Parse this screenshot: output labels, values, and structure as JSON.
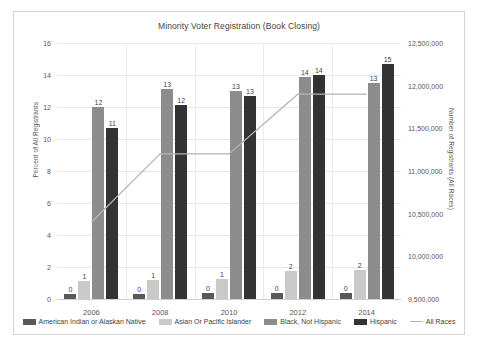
{
  "chart_data": {
    "type": "bar",
    "title": "Minority Voter Registration (Book Closing)",
    "categories": [
      "2006",
      "2008",
      "2010",
      "2012",
      "2014"
    ],
    "xlabel": "",
    "ylabel": "Percent of All Registrants",
    "ylim": [
      0,
      16
    ],
    "y_ticks": [
      "0",
      "2",
      "4",
      "6",
      "8",
      "10",
      "12",
      "14",
      "16"
    ],
    "y2label": "Number of Registrants (All Races)",
    "y2lim": [
      9500000,
      12500000
    ],
    "y2_ticks": [
      "9,500,000",
      "10,000,000",
      "10,500,000",
      "11,000,000",
      "11,500,000",
      "12,000,000",
      "12,500,000"
    ],
    "grid": true,
    "legend_position": "bottom",
    "series": [
      {
        "name": "American Indian or Alaskan Native",
        "type": "bar",
        "axis": "left",
        "color": "#595959",
        "values": [
          0,
          0,
          0,
          0,
          0
        ],
        "labels": [
          "0",
          "0",
          "0",
          "0",
          "0"
        ],
        "plot_values": [
          0.3,
          0.3,
          0.35,
          0.35,
          0.4
        ]
      },
      {
        "name": "Asian Or Pacific Islander",
        "type": "bar",
        "axis": "left",
        "color": "#c9c9c9",
        "values": [
          1,
          1,
          1,
          2,
          2
        ],
        "labels": [
          "1",
          "1",
          "1",
          "2",
          "2"
        ],
        "plot_values": [
          1.1,
          1.2,
          1.25,
          1.75,
          1.8
        ]
      },
      {
        "name": "Black, Not Hispanic",
        "type": "bar",
        "axis": "left",
        "color": "#8c8c8c",
        "values": [
          12,
          13,
          13,
          14,
          13
        ],
        "labels": [
          "12",
          "13",
          "13",
          "14",
          "13"
        ],
        "plot_values": [
          12.0,
          13.1,
          13.0,
          13.9,
          13.5
        ]
      },
      {
        "name": "Hispanic",
        "type": "bar",
        "axis": "left",
        "color": "#333333",
        "values": [
          11,
          12,
          13,
          14,
          15
        ],
        "labels": [
          "11",
          "12",
          "13",
          "14",
          "15"
        ],
        "plot_values": [
          10.7,
          12.1,
          12.7,
          14.0,
          14.7
        ]
      },
      {
        "name": "All Races",
        "type": "line",
        "axis": "right",
        "color": "#b4b4b4",
        "values": [
          10400000,
          11200000,
          11200000,
          11900000,
          11900000
        ]
      }
    ]
  },
  "legend": {
    "items": [
      {
        "label": "American Indian or Alaskan Native",
        "swatch": "swatch-box",
        "color": "#595959"
      },
      {
        "label": "Asian Or Pacific Islander",
        "swatch": "swatch-box",
        "color": "#c9c9c9"
      },
      {
        "label": "Black, Not Hispanic",
        "swatch": "swatch-box",
        "color": "#8c8c8c"
      },
      {
        "label": "Hispanic",
        "swatch": "swatch-box",
        "color": "#333333"
      },
      {
        "label": "All Races",
        "swatch": "swatch-line",
        "color": "#b4b4b4"
      }
    ]
  }
}
